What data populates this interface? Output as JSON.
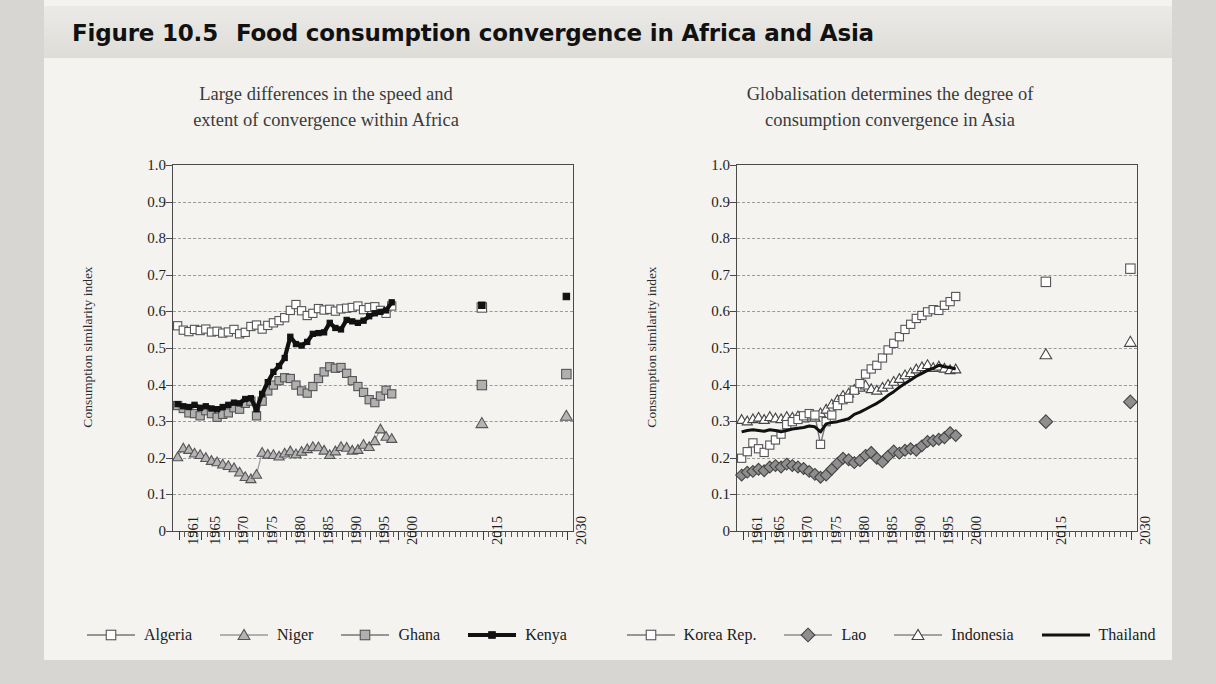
{
  "figure": {
    "number": "Figure 10.5",
    "title": "Food consumption convergence in Africa and Asia"
  },
  "colors": {
    "panel_bg": "#f4f3f0",
    "page_bg": "#d8d6d2",
    "title_text": "#111111",
    "axis": "#4a4a4a",
    "grid": "#9a9a9a",
    "white_marker": "#ffffff",
    "gray_marker": "#9b9b9b",
    "black_series": "#111111"
  },
  "panels": [
    {
      "id": "africa",
      "subtitle_line1": "Large differences in the speed and",
      "subtitle_line2": "extent of convergence within Africa",
      "ylabel": "Consumption similarity index",
      "yticks": [
        "1.0",
        "0.9",
        "0.8",
        "0.7",
        "0.6",
        "0.5",
        "0.4",
        "0.3",
        "0.2",
        "0.1",
        "0"
      ],
      "xticks": [
        "1961",
        "1965",
        "1970",
        "1975",
        "1980",
        "1985",
        "1990",
        "1995",
        "2000",
        "2015",
        "2030"
      ],
      "legend": [
        {
          "name": "Algeria",
          "marker": "square",
          "fill": "#ffffff",
          "stroke": "#555555",
          "line": "#777777",
          "lw": 1.4
        },
        {
          "name": "Niger",
          "marker": "triangle",
          "fill": "#b4b4b4",
          "stroke": "#555555",
          "line": "#9a9a9a",
          "lw": 1.2
        },
        {
          "name": "Ghana",
          "marker": "square",
          "fill": "#b0b0b0",
          "stroke": "#555555",
          "line": "#777777",
          "lw": 1.4
        },
        {
          "name": "Kenya",
          "marker": "square-filled",
          "fill": "#111111",
          "stroke": "#111111",
          "line": "#111111",
          "lw": 4.2
        }
      ]
    },
    {
      "id": "asia",
      "subtitle_line1": "Globalisation determines the degree of",
      "subtitle_line2": "consumption convergence in Asia",
      "ylabel": "Consumption similarity index",
      "yticks": [
        "1.0",
        "0.9",
        "0.8",
        "0.7",
        "0.6",
        "0.5",
        "0.4",
        "0.3",
        "0.2",
        "0.1",
        "0"
      ],
      "xticks": [
        "1961",
        "1965",
        "1970",
        "1975",
        "1980",
        "1985",
        "1990",
        "1995",
        "2000",
        "2015",
        "2030"
      ],
      "legend": [
        {
          "name": "Korea Rep.",
          "marker": "square",
          "fill": "#ffffff",
          "stroke": "#555555",
          "line": "#777777",
          "lw": 1.4
        },
        {
          "name": "Lao",
          "marker": "diamond",
          "fill": "#8e8e8e",
          "stroke": "#444444",
          "line": "#8e8e8e",
          "lw": 1.4
        },
        {
          "name": "Indonesia",
          "marker": "triangle-open",
          "fill": "#ffffff",
          "stroke": "#444444",
          "line": "#888888",
          "lw": 1.2
        },
        {
          "name": "Thailand",
          "marker": "line",
          "fill": "none",
          "stroke": "#111111",
          "line": "#111111",
          "lw": 3.0
        }
      ]
    }
  ],
  "chart_data": [
    {
      "type": "line",
      "title": "Large differences in the speed and extent of convergence within Africa",
      "xlabel": "",
      "ylabel": "Consumption similarity index",
      "ylim": [
        0,
        1.0
      ],
      "ytick_values": [
        0,
        0.1,
        0.2,
        0.3,
        0.4,
        0.5,
        0.6,
        0.7,
        0.8,
        0.9,
        1.0
      ],
      "grid": true,
      "legend_position": "bottom",
      "x": [
        1961,
        1962,
        1963,
        1964,
        1965,
        1966,
        1967,
        1968,
        1969,
        1970,
        1971,
        1972,
        1973,
        1974,
        1975,
        1976,
        1977,
        1978,
        1979,
        1980,
        1981,
        1982,
        1983,
        1984,
        1985,
        1986,
        1987,
        1988,
        1989,
        1990,
        1991,
        1992,
        1993,
        1994,
        1995,
        1996,
        1997,
        1998,
        1999
      ],
      "x_projection": [
        2015,
        2030
      ],
      "series": [
        {
          "name": "Algeria",
          "values": [
            0.558,
            0.546,
            0.542,
            0.548,
            0.545,
            0.549,
            0.541,
            0.543,
            0.538,
            0.541,
            0.548,
            0.536,
            0.54,
            0.556,
            0.56,
            0.549,
            0.559,
            0.566,
            0.572,
            0.58,
            0.6,
            0.616,
            0.599,
            0.586,
            0.592,
            0.605,
            0.601,
            0.603,
            0.598,
            0.604,
            0.606,
            0.608,
            0.612,
            0.602,
            0.608,
            0.61,
            0.6,
            0.592,
            0.612
          ],
          "projection": [
            0.608,
            null
          ]
        },
        {
          "name": "Niger",
          "values": [
            0.2,
            0.224,
            0.22,
            0.21,
            0.206,
            0.198,
            0.19,
            0.186,
            0.18,
            0.176,
            0.17,
            0.158,
            0.146,
            0.14,
            0.152,
            0.212,
            0.207,
            0.206,
            0.202,
            0.21,
            0.216,
            0.208,
            0.215,
            0.222,
            0.228,
            0.227,
            0.218,
            0.206,
            0.216,
            0.228,
            0.226,
            0.218,
            0.22,
            0.234,
            0.228,
            0.244,
            0.276,
            0.256,
            0.25
          ],
          "projection": [
            0.292,
            0.312
          ]
        },
        {
          "name": "Ghana",
          "values": [
            0.34,
            0.332,
            0.32,
            0.318,
            0.312,
            0.326,
            0.318,
            0.308,
            0.316,
            0.32,
            0.334,
            0.33,
            0.346,
            0.352,
            0.312,
            0.352,
            0.38,
            0.396,
            0.408,
            0.416,
            0.414,
            0.396,
            0.38,
            0.374,
            0.392,
            0.414,
            0.432,
            0.446,
            0.442,
            0.444,
            0.428,
            0.408,
            0.392,
            0.376,
            0.356,
            0.348,
            0.366,
            0.382,
            0.372
          ],
          "projection": [
            0.396,
            0.426
          ]
        },
        {
          "name": "Kenya",
          "values": [
            0.344,
            0.338,
            0.336,
            0.342,
            0.334,
            0.338,
            0.332,
            0.33,
            0.336,
            0.342,
            0.348,
            0.346,
            0.358,
            0.36,
            0.33,
            0.372,
            0.404,
            0.432,
            0.448,
            0.47,
            0.528,
            0.508,
            0.504,
            0.514,
            0.536,
            0.538,
            0.54,
            0.566,
            0.552,
            0.548,
            0.574,
            0.57,
            0.566,
            0.572,
            0.584,
            0.592,
            0.596,
            0.6,
            0.622
          ],
          "projection": [
            0.614,
            0.638
          ]
        }
      ]
    },
    {
      "type": "line",
      "title": "Globalisation determines the degree of consumption convergence in Asia",
      "xlabel": "",
      "ylabel": "Consumption similarity index",
      "ylim": [
        0,
        1.0
      ],
      "ytick_values": [
        0,
        0.1,
        0.2,
        0.3,
        0.4,
        0.5,
        0.6,
        0.7,
        0.8,
        0.9,
        1.0
      ],
      "grid": true,
      "legend_position": "bottom",
      "x": [
        1961,
        1962,
        1963,
        1964,
        1965,
        1966,
        1967,
        1968,
        1969,
        1970,
        1971,
        1972,
        1973,
        1974,
        1975,
        1976,
        1977,
        1978,
        1979,
        1980,
        1981,
        1982,
        1983,
        1984,
        1985,
        1986,
        1987,
        1988,
        1989,
        1990,
        1991,
        1992,
        1993,
        1994,
        1995,
        1996,
        1997,
        1998,
        1999
      ],
      "x_projection": [
        2015,
        2030
      ],
      "series": [
        {
          "name": "Korea Rep.",
          "values": [
            0.196,
            0.214,
            0.238,
            0.222,
            0.212,
            0.232,
            0.246,
            0.262,
            0.288,
            0.296,
            0.302,
            0.312,
            0.318,
            0.314,
            0.234,
            0.296,
            0.314,
            0.34,
            0.356,
            0.36,
            0.382,
            0.4,
            0.426,
            0.44,
            0.45,
            0.47,
            0.492,
            0.51,
            0.528,
            0.548,
            0.562,
            0.578,
            0.586,
            0.596,
            0.602,
            0.6,
            0.614,
            0.624,
            0.638
          ],
          "projection": [
            0.678,
            0.714
          ]
        },
        {
          "name": "Lao",
          "values": [
            0.15,
            0.158,
            0.16,
            0.166,
            0.162,
            0.172,
            0.176,
            0.172,
            0.18,
            0.176,
            0.172,
            0.168,
            0.16,
            0.152,
            0.144,
            0.15,
            0.166,
            0.182,
            0.196,
            0.192,
            0.184,
            0.19,
            0.204,
            0.212,
            0.196,
            0.186,
            0.202,
            0.216,
            0.21,
            0.218,
            0.222,
            0.218,
            0.23,
            0.242,
            0.244,
            0.248,
            0.252,
            0.266,
            0.258
          ],
          "projection": [
            0.296,
            0.35
          ]
        },
        {
          "name": "Indonesia",
          "values": [
            0.302,
            0.298,
            0.304,
            0.308,
            0.302,
            0.31,
            0.306,
            0.304,
            0.31,
            0.308,
            0.312,
            0.306,
            0.314,
            0.308,
            0.32,
            0.33,
            0.344,
            0.356,
            0.368,
            0.374,
            0.384,
            0.39,
            0.396,
            0.386,
            0.382,
            0.39,
            0.398,
            0.406,
            0.414,
            0.424,
            0.43,
            0.44,
            0.446,
            0.452,
            0.444,
            0.448,
            0.442,
            0.438,
            0.44
          ],
          "projection": [
            0.48,
            0.514
          ]
        },
        {
          "name": "Thailand",
          "values": [
            0.268,
            0.272,
            0.274,
            0.272,
            0.27,
            0.274,
            0.272,
            0.268,
            0.272,
            0.276,
            0.278,
            0.28,
            0.284,
            0.282,
            0.268,
            0.29,
            0.294,
            0.296,
            0.3,
            0.304,
            0.316,
            0.322,
            0.33,
            0.338,
            0.346,
            0.356,
            0.368,
            0.378,
            0.39,
            0.4,
            0.41,
            0.42,
            0.428,
            0.436,
            0.442,
            0.45,
            0.446,
            0.444,
            0.44
          ],
          "projection": [
            null,
            null
          ]
        }
      ]
    }
  ]
}
